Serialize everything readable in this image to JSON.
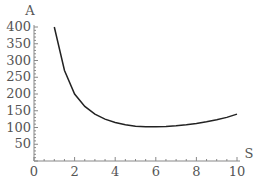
{
  "chart_data": {
    "type": "line",
    "title": "",
    "xlabel": "S",
    "ylabel": "A",
    "xlim": [
      0,
      10
    ],
    "ylim": [
      0,
      400
    ],
    "x_ticks": [
      "0",
      "2",
      "4",
      "6",
      "8",
      "10"
    ],
    "y_ticks": [
      "50",
      "100",
      "150",
      "200",
      "250",
      "300",
      "350",
      "400"
    ],
    "grid": false,
    "series": [
      {
        "name": "A(S)",
        "x": [
          1,
          1.5,
          2,
          2.5,
          3,
          3.5,
          4,
          4.5,
          5,
          5.5,
          6,
          6.5,
          7,
          7.5,
          8,
          8.5,
          9,
          9.5,
          10
        ],
        "y": [
          400,
          270,
          200,
          163,
          140,
          125,
          115,
          108,
          104,
          102,
          102,
          103,
          105,
          108,
          112,
          117,
          123,
          130,
          140
        ]
      }
    ]
  }
}
